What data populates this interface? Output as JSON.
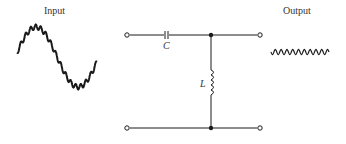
{
  "diagram": {
    "title_input": "Input",
    "title_output": "Output",
    "capacitor_label": "C",
    "inductor_label": "L",
    "circuit_type": "high-pass filter (series C, shunt L)",
    "input_signal": "low-frequency sine with superimposed high-frequency ripple",
    "output_signal": "high-frequency ripple only",
    "colors": {
      "ink": "#1a1a1a",
      "label": "#333333",
      "background": "#ffffff"
    }
  }
}
